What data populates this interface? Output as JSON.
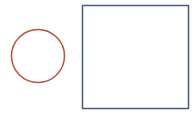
{
  "canvas": {
    "width": 194,
    "height": 113,
    "background": "#ffffff"
  },
  "shapes": {
    "circle": {
      "type": "circle",
      "cx": 38,
      "cy": 56,
      "r": 26.5,
      "stroke": "#c0503a",
      "stroke_width": 1.5,
      "fill": "none"
    },
    "square": {
      "type": "rect",
      "x": 82.5,
      "y": 5.5,
      "width": 106,
      "height": 103,
      "stroke": "#4a5590",
      "stroke_width": 1.5,
      "fill": "none"
    }
  }
}
